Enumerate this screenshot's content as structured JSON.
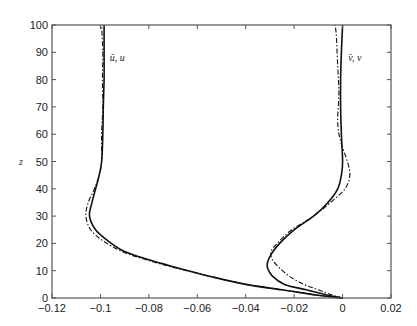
{
  "chart_data": {
    "type": "line",
    "title": "",
    "xlabel": "",
    "ylabel": "z",
    "xlim": [
      -0.12,
      0.02
    ],
    "ylim": [
      0,
      100
    ],
    "grid": false,
    "legend": "none (inline curve labels)",
    "x_ticks": [
      -0.12,
      -0.1,
      -0.08,
      -0.06,
      -0.04,
      -0.02,
      0,
      0.02
    ],
    "x_tick_labels": [
      "−0.12",
      "−0.1",
      "−0.08",
      "−0.06",
      "−0.04",
      "−0.02",
      "0",
      "0.02"
    ],
    "y_ticks": [
      0,
      10,
      20,
      30,
      40,
      50,
      60,
      70,
      80,
      90,
      100
    ],
    "y_tick_labels": [
      "0",
      "10",
      "20",
      "30",
      "40",
      "50",
      "60",
      "70",
      "80",
      "90",
      "100"
    ],
    "annotations": [
      {
        "text": "ū, u",
        "x": -0.097,
        "z": 88
      },
      {
        "text": "v̄, v",
        "x": 0.0015,
        "z": 88
      }
    ],
    "series": [
      {
        "name": "u (solid)",
        "style": "solid",
        "points": [
          [
            0,
            0
          ],
          [
            -0.01,
            1
          ],
          [
            -0.025,
            3
          ],
          [
            -0.04,
            5
          ],
          [
            -0.055,
            8
          ],
          [
            -0.068,
            11
          ],
          [
            -0.08,
            14
          ],
          [
            -0.09,
            17
          ],
          [
            -0.097,
            21
          ],
          [
            -0.102,
            25
          ],
          [
            -0.1045,
            30
          ],
          [
            -0.1035,
            35
          ],
          [
            -0.102,
            40
          ],
          [
            -0.1005,
            45
          ],
          [
            -0.0995,
            50
          ],
          [
            -0.099,
            60
          ],
          [
            -0.0988,
            70
          ],
          [
            -0.0985,
            80
          ],
          [
            -0.0985,
            90
          ],
          [
            -0.0985,
            100
          ]
        ]
      },
      {
        "name": "ū (dash-dot)",
        "style": "dashdot",
        "points": [
          [
            0,
            0
          ],
          [
            -0.01,
            1
          ],
          [
            -0.025,
            3
          ],
          [
            -0.04,
            5
          ],
          [
            -0.055,
            8
          ],
          [
            -0.069,
            11
          ],
          [
            -0.081,
            14
          ],
          [
            -0.091,
            17
          ],
          [
            -0.099,
            21
          ],
          [
            -0.104,
            25
          ],
          [
            -0.106,
            30
          ],
          [
            -0.105,
            35
          ],
          [
            -0.1025,
            40
          ],
          [
            -0.1005,
            45
          ],
          [
            -0.0995,
            50
          ],
          [
            -0.0995,
            60
          ],
          [
            -0.099,
            70
          ],
          [
            -0.0992,
            80
          ],
          [
            -0.099,
            90
          ],
          [
            -0.0995,
            100
          ]
        ]
      },
      {
        "name": "v (solid)",
        "style": "solid",
        "points": [
          [
            0,
            0
          ],
          [
            -0.006,
            1
          ],
          [
            -0.015,
            3
          ],
          [
            -0.024,
            5
          ],
          [
            -0.029,
            8
          ],
          [
            -0.031,
            11
          ],
          [
            -0.031,
            13
          ],
          [
            -0.0295,
            16
          ],
          [
            -0.026,
            20
          ],
          [
            -0.02,
            25
          ],
          [
            -0.012,
            30
          ],
          [
            -0.006,
            35
          ],
          [
            -0.002,
            40
          ],
          [
            -0.0005,
            45
          ],
          [
            0,
            50
          ],
          [
            -0.0005,
            60
          ],
          [
            -0.0008,
            70
          ],
          [
            -0.0008,
            80
          ],
          [
            -0.0005,
            90
          ],
          [
            0,
            100
          ]
        ]
      },
      {
        "name": "v̄ (dash-dot)",
        "style": "dashdot",
        "points": [
          [
            0,
            0
          ],
          [
            -0.004,
            1
          ],
          [
            -0.01,
            3
          ],
          [
            -0.016,
            5
          ],
          [
            -0.022,
            8
          ],
          [
            -0.026,
            11
          ],
          [
            -0.029,
            14
          ],
          [
            -0.0295,
            17
          ],
          [
            -0.027,
            20
          ],
          [
            -0.021,
            25
          ],
          [
            -0.012,
            30
          ],
          [
            -0.005,
            35
          ],
          [
            0.001,
            40
          ],
          [
            0.003,
            45
          ],
          [
            0.002,
            50
          ],
          [
            -0.001,
            58
          ],
          [
            -0.002,
            65
          ],
          [
            -0.0015,
            75
          ],
          [
            -0.002,
            85
          ],
          [
            -0.0025,
            95
          ],
          [
            -0.003,
            100
          ]
        ]
      }
    ]
  }
}
